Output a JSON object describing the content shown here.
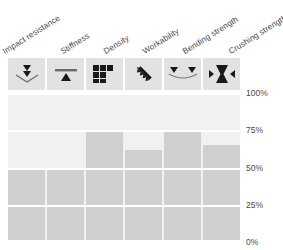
{
  "chart_data": {
    "type": "bar",
    "title": "",
    "xlabel": "",
    "ylabel": "",
    "categories": [
      "Impact resistance",
      "Stiffness",
      "Density",
      "Workability",
      "Bending strength",
      "Crushing strength"
    ],
    "values": [
      50,
      50,
      75,
      62,
      75,
      65
    ],
    "ylim": [
      0,
      100
    ],
    "ytick_labels": [
      "100%",
      "75%",
      "50%",
      "25%",
      "0%"
    ],
    "ytick_values": [
      100,
      75,
      50,
      25,
      0
    ],
    "grid": true,
    "legend": "none",
    "bar_color": "#cfcfcf",
    "track_color": "#f1f1f1",
    "gridline_color": "#ffffff",
    "icon_cell_color": "#e2e2e2",
    "icon_glyph_color": "#1a1a1a"
  },
  "headers": [
    {
      "label": "Impact resistance",
      "left": 8,
      "icon": "double-down-arrow-dent-icon"
    },
    {
      "label": "Stiffness",
      "left": 66,
      "icon": "beam-up-triangle-icon"
    },
    {
      "label": "Density",
      "left": 110,
      "icon": "stacked-blocks-icon"
    },
    {
      "label": "Workability",
      "left": 155,
      "icon": "diagonal-saw-blade-icon"
    },
    {
      "label": "Bending strength",
      "left": 192,
      "icon": "sagging-beam-two-loads-icon"
    },
    {
      "label": "Crushing strength",
      "left": 240,
      "icon": "hourglass-compression-arrows-icon"
    }
  ],
  "axis": {
    "ticks": [
      {
        "label": "100%",
        "value": 100
      },
      {
        "label": "75%",
        "value": 75
      },
      {
        "label": "50%",
        "value": 50
      },
      {
        "label": "25%",
        "value": 25
      },
      {
        "label": "0%",
        "value": 0
      }
    ]
  }
}
